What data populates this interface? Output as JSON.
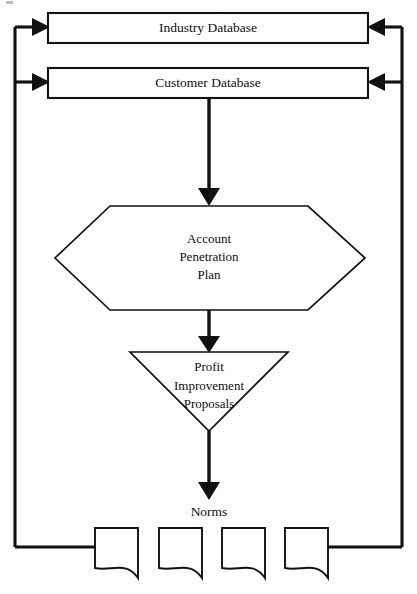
{
  "diagram": {
    "type": "flowchart",
    "colors": {
      "stroke": "#111111",
      "fill": "#ffffff",
      "text": "#0d0d0d"
    },
    "nodes": {
      "industry_database": {
        "label": "Industry Database",
        "shape": "rectangle"
      },
      "customer_database": {
        "label": "Customer Database",
        "shape": "rectangle"
      },
      "account_penetration_plan": {
        "label_line1": "Account",
        "label_line2": "Penetration",
        "label_line3": "Plan",
        "shape": "hexagon"
      },
      "profit_improvement_proposals": {
        "label_line1": "Profit",
        "label_line2": "Improvement",
        "label_line3": "Proposals",
        "shape": "inverted-triangle"
      },
      "norms": {
        "label": "Norms",
        "shape": "text"
      },
      "documents": [
        {
          "label": ""
        },
        {
          "label": ""
        },
        {
          "label": ""
        },
        {
          "label": ""
        }
      ]
    },
    "edges": [
      {
        "from": "customer_database",
        "to": "account_penetration_plan",
        "style": "arrow-down"
      },
      {
        "from": "account_penetration_plan",
        "to": "profit_improvement_proposals",
        "style": "arrow-down"
      },
      {
        "from": "profit_improvement_proposals",
        "to": "norms",
        "style": "arrow-down"
      },
      {
        "from": "documents",
        "to": "industry_database",
        "style": "feedback-left-arrow"
      },
      {
        "from": "documents",
        "to": "customer_database",
        "style": "feedback-left-arrow"
      },
      {
        "from": "documents",
        "to": "industry_database",
        "style": "feedback-right-arrow"
      },
      {
        "from": "documents",
        "to": "customer_database",
        "style": "feedback-right-arrow"
      }
    ]
  }
}
